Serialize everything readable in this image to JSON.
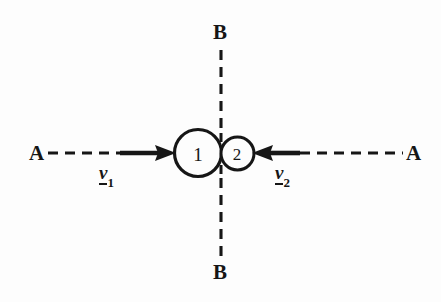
{
  "figure": {
    "type": "physics-collision-diagram",
    "background_color": "#fdfdfd",
    "ink_color": "#161616",
    "axes": [
      {
        "name": "line-of-centres",
        "label": "A",
        "orientation": "horizontal",
        "left_label": "A",
        "right_label": "A",
        "y": 153,
        "style": "dashed"
      },
      {
        "name": "plane-of-contact",
        "label": "B",
        "orientation": "vertical",
        "top_label": "B",
        "bottom_label": "B",
        "x": 221,
        "style": "dashed"
      }
    ],
    "bodies": [
      {
        "name": "sphere-1",
        "label": "1",
        "cx": 198,
        "cy": 153,
        "r": 23.5,
        "stroke_width": 3.2
      },
      {
        "name": "sphere-2",
        "label": "2",
        "cx": 237.5,
        "cy": 153.5,
        "r": 16.5,
        "stroke_width": 3.0
      }
    ],
    "vectors": [
      {
        "name": "velocity-1",
        "symbol": "v",
        "subscript": "1",
        "underlined": true,
        "direction": "right",
        "tail_x": 120,
        "head_x": 175,
        "y": 153,
        "label_x": 100,
        "label_y": 165
      },
      {
        "name": "velocity-2",
        "symbol": "v",
        "subscript": "2",
        "underlined": true,
        "direction": "left",
        "tail_x": 300,
        "head_x": 253,
        "y": 153,
        "label_x": 276,
        "label_y": 165
      }
    ],
    "letters": {
      "axis_a_left": "A",
      "axis_a_right": "A",
      "axis_b_top": "B",
      "axis_b_bottom": "B",
      "body_1": "1",
      "body_2": "2",
      "velocity_symbol": "v",
      "velocity_1_subscript": "1",
      "velocity_2_subscript": "2"
    }
  }
}
